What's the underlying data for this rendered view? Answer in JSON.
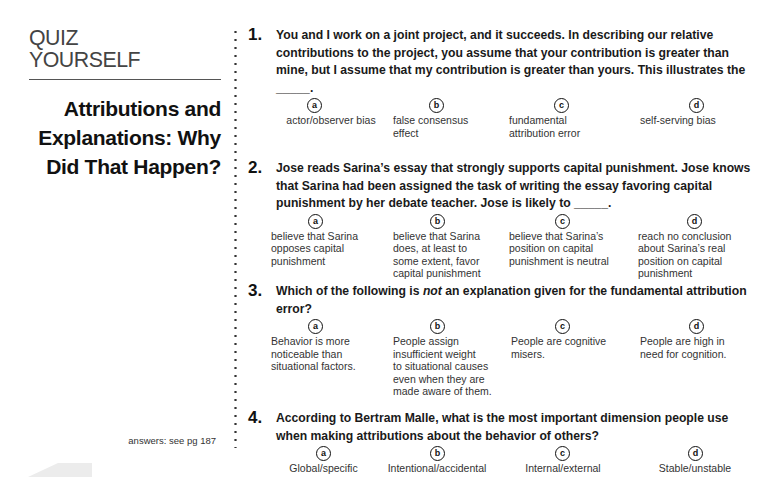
{
  "sidebar": {
    "quiz_title_line1": "QUIZ",
    "quiz_title_line2": "YOURSELF",
    "section_title_line1": "Attributions and",
    "section_title_line2": "Explanations: Why",
    "section_title_line3": "Did That Happen?",
    "answers_note": "answers: see pg 187"
  },
  "questions": [
    {
      "number": "1.",
      "text": "You and I work on a joint project, and it succeeds. In describing our relative contributions to the project, you assume that your contribution is greater than mine, but I assume that my contribution is greater than yours. This illustrates the _____.",
      "options": [
        {
          "letter": "a",
          "text": "actor/observer bias"
        },
        {
          "letter": "b",
          "text": "false consensus\neffect"
        },
        {
          "letter": "c",
          "text": "fundamental\nattribution error"
        },
        {
          "letter": "d",
          "text": "self-serving bias"
        }
      ]
    },
    {
      "number": "2.",
      "text": "Jose reads Sarina’s essay that strongly supports capital punishment. Jose knows that Sarina had been assigned the task of writing the essay favoring capital punishment by her debate teacher. Jose is likely to _____.",
      "options": [
        {
          "letter": "a",
          "text": "believe that Sarina\nopposes capital\npunishment"
        },
        {
          "letter": "b",
          "text": "believe that Sarina\ndoes, at least to\nsome extent, favor\ncapital punishment"
        },
        {
          "letter": "c",
          "text": "believe that Sarina’s\nposition on capital\npunishment is neutral"
        },
        {
          "letter": "d",
          "text": "reach no conclusion\nabout Sarina’s real\nposition on capital\npunishment"
        }
      ]
    },
    {
      "number": "3.",
      "text_before": "Which of the following is ",
      "text_emphasis": "not",
      "text_after": " an explanation given for the fundamental attribution error?",
      "options": [
        {
          "letter": "a",
          "text": "Behavior is more\nnoticeable than\nsituational factors."
        },
        {
          "letter": "b",
          "text": "People assign\ninsufficient weight\nto situational causes\neven when they are\nmade aware of them."
        },
        {
          "letter": "c",
          "text": "People are cognitive\nmisers."
        },
        {
          "letter": "d",
          "text": "People are high in\nneed for cognition."
        }
      ]
    },
    {
      "number": "4.",
      "text": "According to Bertram Malle, what is the most important dimension people use when making attributions about the behavior of others?",
      "options": [
        {
          "letter": "a",
          "text": "Global/specific"
        },
        {
          "letter": "b",
          "text": "Intentional/accidental"
        },
        {
          "letter": "c",
          "text": "Internal/external"
        },
        {
          "letter": "d",
          "text": "Stable/unstable"
        }
      ]
    }
  ]
}
